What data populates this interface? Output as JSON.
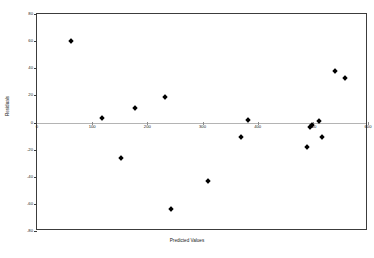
{
  "chart_data": {
    "type": "scatter",
    "title": "",
    "xlabel": "Predicted Values",
    "ylabel": "Residuals",
    "xlim": [
      0,
      600
    ],
    "ylim": [
      -80,
      80
    ],
    "xticks": [
      0,
      100,
      200,
      300,
      400,
      500,
      600
    ],
    "xticklabels": [
      "0",
      "100",
      "200",
      "300",
      "400",
      "500",
      "600"
    ],
    "yticks": [
      -80,
      -60,
      -40,
      -20,
      0,
      20,
      40,
      60,
      80
    ],
    "yticklabels": [
      "-80",
      "-60",
      "-40",
      "-20",
      "0",
      "20",
      "40",
      "60",
      "80"
    ],
    "grid": false,
    "legend": null,
    "reference_line": {
      "axis": "horizontal",
      "value": 0,
      "color": "#b4b4b4"
    },
    "marker": "diamond",
    "marker_color": "#000000",
    "points": [
      {
        "x": 62,
        "y": 60
      },
      {
        "x": 118,
        "y": 3
      },
      {
        "x": 152,
        "y": -26
      },
      {
        "x": 178,
        "y": 11
      },
      {
        "x": 232,
        "y": 19
      },
      {
        "x": 242,
        "y": -64
      },
      {
        "x": 310,
        "y": -43
      },
      {
        "x": 370,
        "y": -11
      },
      {
        "x": 382,
        "y": 2
      },
      {
        "x": 489,
        "y": -18
      },
      {
        "x": 494,
        "y": -3
      },
      {
        "x": 499,
        "y": -2
      },
      {
        "x": 512,
        "y": 1
      },
      {
        "x": 516,
        "y": -11
      },
      {
        "x": 540,
        "y": 38
      },
      {
        "x": 558,
        "y": 33
      }
    ]
  }
}
